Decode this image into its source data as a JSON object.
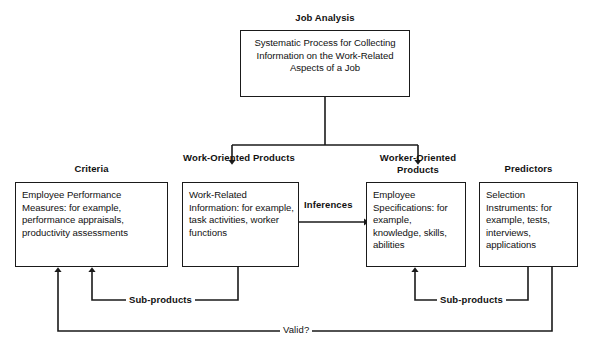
{
  "diagram": {
    "nodes": {
      "job_analysis": {
        "title": "Job Analysis",
        "body": "Systematic Process for Collecting Information on the Work-Related Aspects of a Job"
      },
      "criteria": {
        "title": "Criteria",
        "body": "Employee Performance Measures: for example, performance appraisals, productivity assessments"
      },
      "work_oriented": {
        "title": "Work-Oriented Products",
        "body": "Work-Related Information: for example, task activities, worker functions"
      },
      "worker_oriented": {
        "title": "Worker-Oriented Products",
        "body": "Employee Specifications: for example, knowledge, skills, abilities"
      },
      "predictors": {
        "title": "Predictors",
        "body": "Selection Instruments: for example, tests, interviews, applications"
      }
    },
    "edge_labels": {
      "inferences": "Inferences",
      "sub_products_left": "Sub-products",
      "sub_products_right": "Sub-products",
      "valid": "Valid?"
    },
    "colors": {
      "line": "#1a1a1a",
      "text": "#111111",
      "background": "#ffffff"
    }
  }
}
